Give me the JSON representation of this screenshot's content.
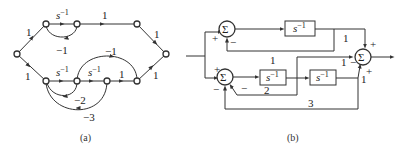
{
  "figure_a": {
    "caption": "(a)",
    "type": "signal-flow-graph",
    "branches": [
      {
        "from": "in",
        "to": "n1",
        "gain": "1"
      },
      {
        "from": "n1",
        "to": "n2",
        "gain": "s⁻¹"
      },
      {
        "from": "n2",
        "to": "n1",
        "gain": "−1"
      },
      {
        "from": "n2",
        "to": "n3",
        "gain": "1"
      },
      {
        "from": "n3",
        "to": "out",
        "gain": "1"
      },
      {
        "from": "in",
        "to": "m1",
        "gain": "1"
      },
      {
        "from": "m1",
        "to": "m2",
        "gain": "s⁻¹"
      },
      {
        "from": "m2",
        "to": "m3",
        "gain": "s⁻¹"
      },
      {
        "from": "m3",
        "to": "m4",
        "gain": "1"
      },
      {
        "from": "m4",
        "to": "out",
        "gain": "1"
      },
      {
        "from": "m2",
        "to": "m4",
        "gain": "−1"
      },
      {
        "from": "m2",
        "to": "m1",
        "gain": "−2"
      },
      {
        "from": "m3",
        "to": "m1",
        "gain": "−3"
      }
    ],
    "labels": {
      "in_top": "1",
      "in_bottom": "1",
      "top_s": "s",
      "top_sexp": "−1",
      "top_fb": "−1",
      "top_mid": "1",
      "top_out": "1",
      "bot_s1": "s",
      "bot_s1exp": "−1",
      "bot_s2": "s",
      "bot_s2exp": "−1",
      "bot_mid": "1",
      "bot_out": "1",
      "ff": "−1",
      "fb2": "−2",
      "fb3": "−3"
    }
  },
  "figure_b": {
    "caption": "(b)",
    "type": "block-diagram",
    "sum_symbol": "Σ",
    "blocks": [
      {
        "id": "b1",
        "s": "s",
        "exp": "−1"
      },
      {
        "id": "b2",
        "s": "s",
        "exp": "−1"
      },
      {
        "id": "b3",
        "s": "s",
        "exp": "−1"
      }
    ],
    "gains": {
      "top_out": "1",
      "top_fb": "1",
      "mid_ff": "1",
      "fb2": "2",
      "fb3": "3",
      "bot_out": "1"
    },
    "signs": {
      "sum1_in": "+",
      "sum1_fb": "−",
      "sum2_in": "+",
      "sum2_fb2": "−",
      "sum2_fb3": "−",
      "sum3_top": "+",
      "sum3_mid": "−",
      "sum3_bot": "+"
    }
  }
}
